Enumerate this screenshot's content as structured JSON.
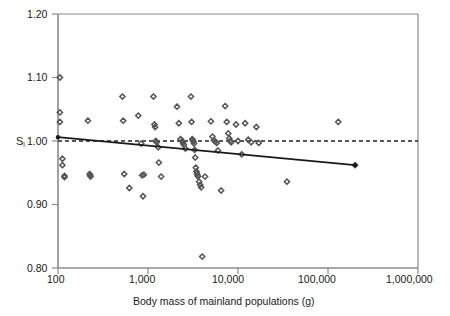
{
  "chart_data": {
    "type": "scatter",
    "title": "",
    "xlabel": "Body mass of mainland populations (g)",
    "ylabel": "S",
    "ylabel_sub": "i",
    "xscale": "log",
    "yscale": "linear",
    "xlim": [
      100,
      1000000
    ],
    "ylim": [
      0.8,
      1.2
    ],
    "xticks": [
      100,
      1000,
      10000,
      100000,
      1000000
    ],
    "xticklabels": [
      "100",
      "1,000",
      "10,000",
      "100,000",
      "1,000,000"
    ],
    "yticks": [
      0.8,
      0.9,
      1.0,
      1.1,
      1.2
    ],
    "yticklabels": [
      "0.80",
      "0.90",
      "1.00",
      "1.10",
      "1.20"
    ],
    "grid": false,
    "legend": "none",
    "marker": "diamond-open",
    "marker_color": "#555555",
    "reference_line": {
      "style": "dashed",
      "y": 1.0,
      "label": "S_i = 1.00",
      "color": "#222222"
    },
    "regression_line": {
      "style": "solid",
      "color": "#1a1a1a",
      "x_start": 100,
      "y_start": 1.006,
      "x_end": 200000,
      "y_end": 0.962
    },
    "points": [
      {
        "x": 105,
        "y": 1.1
      },
      {
        "x": 105,
        "y": 1.045
      },
      {
        "x": 105,
        "y": 1.03
      },
      {
        "x": 112,
        "y": 0.972
      },
      {
        "x": 112,
        "y": 0.962
      },
      {
        "x": 118,
        "y": 0.945
      },
      {
        "x": 118,
        "y": 0.943
      },
      {
        "x": 215,
        "y": 1.032
      },
      {
        "x": 225,
        "y": 0.948
      },
      {
        "x": 228,
        "y": 0.946
      },
      {
        "x": 230,
        "y": 0.944
      },
      {
        "x": 520,
        "y": 1.07
      },
      {
        "x": 530,
        "y": 1.032
      },
      {
        "x": 545,
        "y": 0.948
      },
      {
        "x": 620,
        "y": 0.926
      },
      {
        "x": 780,
        "y": 1.04
      },
      {
        "x": 840,
        "y": 0.996
      },
      {
        "x": 860,
        "y": 0.946
      },
      {
        "x": 880,
        "y": 0.913
      },
      {
        "x": 900,
        "y": 0.947
      },
      {
        "x": 1150,
        "y": 1.07
      },
      {
        "x": 1180,
        "y": 1.026
      },
      {
        "x": 1200,
        "y": 1.022
      },
      {
        "x": 1220,
        "y": 1.0
      },
      {
        "x": 1250,
        "y": 0.998
      },
      {
        "x": 1300,
        "y": 0.99
      },
      {
        "x": 1320,
        "y": 0.966
      },
      {
        "x": 1400,
        "y": 0.944
      },
      {
        "x": 2100,
        "y": 1.054
      },
      {
        "x": 2200,
        "y": 1.028
      },
      {
        "x": 2300,
        "y": 1.003
      },
      {
        "x": 2400,
        "y": 1.0
      },
      {
        "x": 2450,
        "y": 0.997
      },
      {
        "x": 2500,
        "y": 0.994
      },
      {
        "x": 2600,
        "y": 0.988
      },
      {
        "x": 3000,
        "y": 1.07
      },
      {
        "x": 3050,
        "y": 1.03
      },
      {
        "x": 3100,
        "y": 1.003
      },
      {
        "x": 3150,
        "y": 1.001
      },
      {
        "x": 3200,
        "y": 0.999
      },
      {
        "x": 3250,
        "y": 0.996
      },
      {
        "x": 3300,
        "y": 0.986
      },
      {
        "x": 3350,
        "y": 0.974
      },
      {
        "x": 3400,
        "y": 0.958
      },
      {
        "x": 3450,
        "y": 0.952
      },
      {
        "x": 3500,
        "y": 0.949
      },
      {
        "x": 3550,
        "y": 0.946
      },
      {
        "x": 3600,
        "y": 0.944
      },
      {
        "x": 3700,
        "y": 0.936
      },
      {
        "x": 3800,
        "y": 0.931
      },
      {
        "x": 3900,
        "y": 0.927
      },
      {
        "x": 4000,
        "y": 0.818
      },
      {
        "x": 4300,
        "y": 0.944
      },
      {
        "x": 5000,
        "y": 1.031
      },
      {
        "x": 5200,
        "y": 1.007
      },
      {
        "x": 5400,
        "y": 1.001
      },
      {
        "x": 5600,
        "y": 0.999
      },
      {
        "x": 5800,
        "y": 0.997
      },
      {
        "x": 6000,
        "y": 0.985
      },
      {
        "x": 6500,
        "y": 0.922
      },
      {
        "x": 7200,
        "y": 1.055
      },
      {
        "x": 7500,
        "y": 1.03
      },
      {
        "x": 7800,
        "y": 1.012
      },
      {
        "x": 8000,
        "y": 1.004
      },
      {
        "x": 8200,
        "y": 1.0
      },
      {
        "x": 8400,
        "y": 0.998
      },
      {
        "x": 9500,
        "y": 1.026
      },
      {
        "x": 10000,
        "y": 1.0
      },
      {
        "x": 11000,
        "y": 0.979
      },
      {
        "x": 12000,
        "y": 1.028
      },
      {
        "x": 13000,
        "y": 1.002
      },
      {
        "x": 14000,
        "y": 0.998
      },
      {
        "x": 16000,
        "y": 1.022
      },
      {
        "x": 17000,
        "y": 0.997
      },
      {
        "x": 35000,
        "y": 0.936
      },
      {
        "x": 130000,
        "y": 1.03
      },
      {
        "x": 200000,
        "y": 0.962
      }
    ]
  },
  "annotations": {
    "x_axis_title": "Body mass of mainland populations (g)",
    "y_axis_title": "S"
  }
}
